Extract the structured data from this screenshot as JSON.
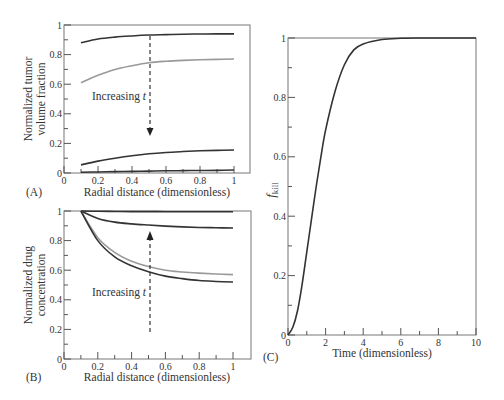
{
  "chart_data": [
    {
      "panel": "A",
      "type": "line",
      "title": "",
      "xlabel": "Radial distance (dimensionless)",
      "ylabel": "Normalized tumor volume fraction",
      "xlim": [
        0,
        1
      ],
      "ylim": [
        0,
        1
      ],
      "x_ticks": [
        "0",
        "0.2",
        "0.4",
        "0.6",
        "0.8",
        "1"
      ],
      "y_ticks": [
        "0",
        "0.2",
        "0.4",
        "0.6",
        "0.8",
        "1"
      ],
      "annotation": "Increasing t",
      "arrow_direction": "down",
      "x": [
        0.1,
        0.2,
        0.3,
        0.4,
        0.5,
        0.6,
        0.7,
        0.8,
        0.9,
        1.0
      ],
      "series": [
        {
          "name": "t1",
          "color": "#333333",
          "values": [
            0.88,
            0.905,
            0.918,
            0.926,
            0.932,
            0.935,
            0.938,
            0.939,
            0.94,
            0.94
          ]
        },
        {
          "name": "t2",
          "color": "#999999",
          "values": [
            0.61,
            0.66,
            0.7,
            0.725,
            0.745,
            0.755,
            0.761,
            0.765,
            0.768,
            0.77
          ]
        },
        {
          "name": "t3",
          "color": "#333333",
          "values": [
            0.055,
            0.08,
            0.1,
            0.117,
            0.13,
            0.139,
            0.145,
            0.15,
            0.153,
            0.155
          ]
        },
        {
          "name": "t4",
          "color": "#333333",
          "values": [
            0.005,
            0.007,
            0.009,
            0.011,
            0.013,
            0.015,
            0.016,
            0.017,
            0.018,
            0.02
          ]
        }
      ]
    },
    {
      "panel": "B",
      "type": "line",
      "title": "",
      "xlabel": "Radial distance (dimensionless)",
      "ylabel": "Normalized drug concentration",
      "xlim": [
        0,
        1
      ],
      "ylim": [
        0,
        1
      ],
      "x_ticks": [
        "0",
        "0.2",
        "0.4",
        "0.6",
        "0.8",
        "1"
      ],
      "y_ticks": [
        "0",
        "0.2",
        "0.4",
        "0.6",
        "0.8",
        "1"
      ],
      "annotation": "Increasing t",
      "arrow_direction": "up",
      "x": [
        0.1,
        0.2,
        0.3,
        0.4,
        0.5,
        0.6,
        0.7,
        0.8,
        0.9,
        1.0
      ],
      "series": [
        {
          "name": "t1",
          "color": "#333333",
          "values": [
            1.0,
            0.998,
            0.997,
            0.996,
            0.996,
            0.995,
            0.995,
            0.995,
            0.995,
            0.995
          ]
        },
        {
          "name": "t2",
          "color": "#333333",
          "values": [
            1.0,
            0.95,
            0.925,
            0.913,
            0.905,
            0.898,
            0.893,
            0.889,
            0.887,
            0.885
          ]
        },
        {
          "name": "t3",
          "color": "#999999",
          "values": [
            1.0,
            0.82,
            0.72,
            0.66,
            0.625,
            0.6,
            0.588,
            0.58,
            0.574,
            0.57
          ]
        },
        {
          "name": "t4",
          "color": "#333333",
          "values": [
            1.0,
            0.8,
            0.69,
            0.63,
            0.59,
            0.56,
            0.543,
            0.53,
            0.524,
            0.52
          ]
        }
      ]
    },
    {
      "panel": "C",
      "type": "line",
      "title": "",
      "xlabel": "Time (dimensionless)",
      "ylabel": "f_kill",
      "xlim": [
        0,
        10
      ],
      "ylim": [
        0,
        1
      ],
      "x_ticks": [
        "0",
        "2",
        "4",
        "6",
        "8",
        "10"
      ],
      "y_ticks": [
        "0",
        "0.2",
        "0.4",
        "0.6",
        "0.8",
        "1"
      ],
      "x": [
        0,
        0.25,
        0.5,
        0.75,
        1.0,
        1.25,
        1.5,
        1.75,
        2.0,
        2.5,
        3.0,
        3.5,
        4.0,
        5.0,
        6.0,
        7.0,
        8.0,
        10.0
      ],
      "series": [
        {
          "name": "f_kill",
          "color": "#333333",
          "values": [
            0,
            0.025,
            0.08,
            0.17,
            0.28,
            0.39,
            0.5,
            0.6,
            0.69,
            0.82,
            0.91,
            0.96,
            0.98,
            0.995,
            0.999,
            1.0,
            1.0,
            1.0
          ]
        }
      ]
    }
  ],
  "labels": {
    "panelA": "(A)",
    "panelB": "(B)",
    "panelC": "(C)",
    "a_ylabel1": "Normalized tumor",
    "a_ylabel2": "volume fraction",
    "b_ylabel1": "Normalized drug",
    "b_ylabel2": "concentration",
    "c_ylabel_main": "f",
    "c_ylabel_sub": "kill",
    "xlabel_radial": "Radial distance (dimensionless)",
    "xlabel_time": "Time (dimensionless)",
    "annot_main": "Increasing ",
    "annot_t": "t"
  }
}
